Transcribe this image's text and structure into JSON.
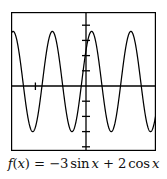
{
  "figure": {
    "caption_parts": {
      "fname": "f",
      "open_paren": "(",
      "arg": "x",
      "close_paren": ")",
      "equals": "=",
      "coef1": "−3",
      "func1": "sin",
      "var1": "x",
      "plus": "+",
      "coef2": "2",
      "func2": "cos",
      "var2": "x"
    },
    "caption_text": "f(x) = −3 sin x + 2 cos x",
    "colors": {
      "curve": "#000000",
      "axis": "#000000",
      "frame": "#000000",
      "background": "#ffffff"
    }
  },
  "chart_data": {
    "type": "line",
    "subtitle": "",
    "xlabel": "",
    "ylabel": "",
    "grid": false,
    "legend": "none",
    "expression": "-3*sin(x) + 2*cos(x)",
    "amplitude": 3.606,
    "period": 6.283,
    "xlim": [
      -7.6,
      15.6
    ],
    "ylim": [
      -5.0,
      5.0
    ],
    "x_axis_position_y": 0,
    "y_axis_position_x": 0,
    "y_tick_values": [
      -4,
      -3,
      -2,
      -1,
      1,
      2,
      3,
      4
    ],
    "x_tick_values": [
      -3.14159
    ],
    "x_tick_labels": [],
    "y_tick_labels": [],
    "x": [
      -7.6,
      -7.2,
      -6.8,
      -6.4,
      -6.0,
      -5.6,
      -5.2,
      -4.8,
      -4.4,
      -4.0,
      -3.6,
      -3.2,
      -2.8,
      -2.4,
      -2.0,
      -1.6,
      -1.2,
      -0.8,
      -0.4,
      0.0,
      0.4,
      0.8,
      1.2,
      1.6,
      2.0,
      2.4,
      2.8,
      3.2,
      3.6,
      4.0,
      4.4,
      4.8,
      5.2,
      5.6,
      6.0,
      6.4,
      6.8,
      7.2,
      7.6,
      8.0,
      8.4,
      8.8,
      9.2,
      9.6,
      10.0,
      10.4,
      10.8,
      11.2,
      11.6,
      12.0,
      12.4,
      12.8,
      13.2,
      13.6,
      14.0,
      14.4,
      14.8,
      15.2,
      15.6
    ],
    "y": [
      -1.14,
      -0.08,
      0.99,
      1.98,
      2.79,
      3.36,
      3.6,
      3.51,
      3.08,
      2.36,
      1.41,
      0.34,
      -0.76,
      -1.79,
      -2.65,
      -3.26,
      -3.57,
      -3.54,
      -3.17,
      -2.5,
      -1.59,
      -0.54,
      0.55,
      1.61,
      2.5,
      3.17,
      3.54,
      3.57,
      3.25,
      2.64,
      1.78,
      0.75,
      -0.35,
      -1.42,
      -2.37,
      -3.08,
      -3.51,
      -3.6,
      -3.36,
      -2.78,
      -1.97,
      -0.98,
      0.09,
      1.15,
      2.13,
      2.9,
      3.42,
      3.6,
      3.45,
      2.96,
      2.19,
      1.2,
      0.12,
      -0.97,
      -1.96,
      -2.78,
      -3.35,
      -3.59,
      -3.51
    ]
  }
}
